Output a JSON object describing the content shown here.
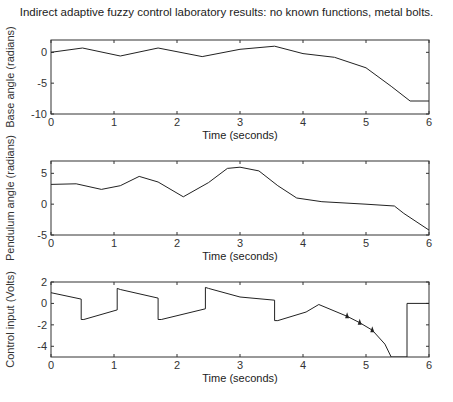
{
  "title": "Indirect adaptive fuzzy control laboratory results:  no known functions, metal bolts.",
  "chart_data": [
    {
      "type": "line",
      "title": "Indirect adaptive fuzzy control laboratory results:  no known functions, metal bolts.",
      "xlabel": "Time (seconds)",
      "ylabel": "Base angle (radians)",
      "xlim": [
        0,
        6
      ],
      "ylim": [
        -10,
        2
      ],
      "xticks": [
        "0",
        "1",
        "2",
        "3",
        "4",
        "5",
        "6"
      ],
      "yticks": [
        "0",
        "-5",
        "-10"
      ],
      "grid": false,
      "x": [
        0,
        0.5,
        1.1,
        1.7,
        2.4,
        3.0,
        3.55,
        4.0,
        4.5,
        5.0,
        5.4,
        5.7,
        6.0
      ],
      "values": [
        0,
        0.7,
        -0.6,
        0.7,
        -0.7,
        0.5,
        1.0,
        -0.2,
        -0.8,
        -2.5,
        -5.5,
        -7.9,
        -7.9
      ]
    },
    {
      "type": "line",
      "xlabel": "Time (seconds)",
      "ylabel": "Pendulum angle (radians)",
      "xlim": [
        0,
        6
      ],
      "ylim": [
        -5,
        7
      ],
      "xticks": [
        "0",
        "1",
        "2",
        "3",
        "4",
        "5",
        "6"
      ],
      "yticks": [
        "5",
        "0",
        "-5"
      ],
      "grid": false,
      "x": [
        0,
        0.4,
        0.8,
        1.1,
        1.4,
        1.7,
        2.1,
        2.5,
        2.8,
        3.0,
        3.3,
        3.6,
        3.9,
        4.3,
        5.0,
        5.45,
        5.6,
        6.0
      ],
      "values": [
        3.2,
        3.3,
        2.4,
        3.0,
        4.5,
        3.6,
        1.2,
        3.5,
        5.8,
        6.0,
        5.4,
        3.0,
        1.0,
        0.4,
        0.0,
        -0.3,
        -1.5,
        -4.2
      ]
    },
    {
      "type": "line",
      "xlabel": "Time (seconds)",
      "ylabel": "Control input (Volts)",
      "xlim": [
        0,
        6
      ],
      "ylim": [
        -5,
        2
      ],
      "xticks": [
        "0",
        "1",
        "2",
        "3",
        "4",
        "5",
        "6"
      ],
      "yticks": [
        "2",
        "0",
        "-2",
        "-4"
      ],
      "grid": false,
      "x": [
        0,
        0.48,
        0.48,
        0.52,
        1.05,
        1.05,
        1.1,
        1.7,
        1.7,
        1.75,
        2.45,
        2.45,
        2.5,
        3.0,
        3.55,
        3.55,
        3.6,
        4.05,
        4.25,
        4.7,
        4.9,
        5.1,
        5.3,
        5.4,
        5.65,
        5.65,
        6.0
      ],
      "values": [
        1.0,
        0.4,
        -1.5,
        -1.5,
        -0.6,
        1.4,
        1.3,
        0.5,
        -1.5,
        -1.5,
        -0.5,
        1.5,
        1.4,
        0.6,
        0.3,
        -1.6,
        -1.6,
        -0.8,
        -0.1,
        -1.2,
        -1.8,
        -2.5,
        -3.8,
        -5.0,
        -5.0,
        0.0,
        0.0
      ]
    }
  ]
}
